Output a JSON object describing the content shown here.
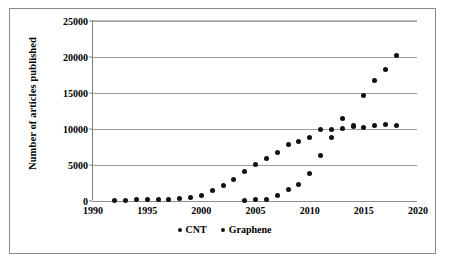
{
  "chart_data": {
    "type": "scatter",
    "title": "",
    "xlabel": "",
    "ylabel": "Number of articles published",
    "xlim": [
      1990,
      2020
    ],
    "ylim": [
      0,
      25000
    ],
    "grid": true,
    "legend_position": "bottom-center",
    "x_ticks": [
      "1990",
      "1995",
      "2000",
      "2005",
      "2010",
      "2015",
      "2020"
    ],
    "y_ticks": [
      "0",
      "5000",
      "10000",
      "15000",
      "20000",
      "25000"
    ],
    "series": [
      {
        "name": "CNT",
        "color": "#111111",
        "x": [
          1992,
          1993,
          1994,
          1995,
          1996,
          1997,
          1998,
          1999,
          2000,
          2001,
          2002,
          2003,
          2004,
          2005,
          2006,
          2007,
          2008,
          2009,
          2010,
          2011,
          2012,
          2013,
          2014,
          2015,
          2016,
          2017,
          2018
        ],
        "values": [
          60,
          120,
          150,
          170,
          190,
          230,
          380,
          520,
          800,
          1450,
          2150,
          2950,
          4150,
          5100,
          5900,
          6800,
          7900,
          8250,
          8850,
          9950,
          9900,
          11450,
          10450,
          10250,
          10500,
          10650,
          10450
        ]
      },
      {
        "name": "Graphene",
        "color": "#111111",
        "x": [
          2004,
          2005,
          2006,
          2007,
          2008,
          2009,
          2010,
          2011,
          2012,
          2013,
          2014,
          2015,
          2016,
          2017,
          2018
        ],
        "values": [
          120,
          160,
          240,
          760,
          1550,
          2280,
          3850,
          6280,
          8850,
          10050,
          10400,
          14600,
          16750,
          18250,
          20150
        ]
      }
    ]
  },
  "legend": {
    "entries": [
      {
        "label": "CNT"
      },
      {
        "label": "Graphene"
      }
    ]
  },
  "axes": {
    "y_title": "Number of articles published"
  }
}
